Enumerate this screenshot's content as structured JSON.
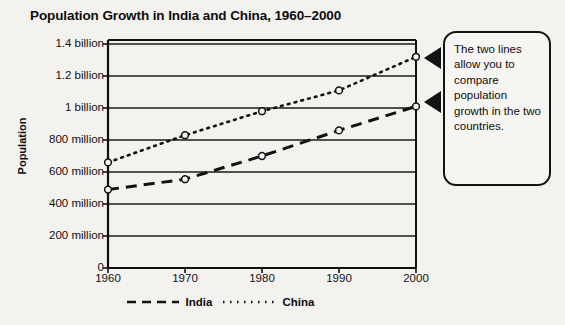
{
  "chart_data": {
    "type": "line",
    "title": "Population Growth in India and China, 1960–2000",
    "xlabel": "",
    "ylabel": "Population",
    "x": [
      1960,
      1970,
      1980,
      1990,
      2000
    ],
    "xtick_labels": [
      "1960",
      "1970",
      "1980",
      "1990",
      "2000"
    ],
    "ylim": [
      0,
      1400000000
    ],
    "ytick_values": [
      0,
      200000000,
      400000000,
      600000000,
      800000000,
      1000000000,
      1200000000,
      1400000000
    ],
    "ytick_labels": [
      "0",
      "200 million",
      "400 million",
      "600 million",
      "800 million",
      "1 billion",
      "1.2 billion",
      "1.4 billion"
    ],
    "grid": true,
    "legend_position": "below",
    "series": [
      {
        "name": "India",
        "style": "dashed",
        "marker": "open-circle",
        "values": [
          490000000,
          555000000,
          700000000,
          860000000,
          1010000000
        ]
      },
      {
        "name": "China",
        "style": "dotted",
        "marker": "open-circle",
        "values": [
          660000000,
          830000000,
          980000000,
          1110000000,
          1320000000
        ]
      }
    ]
  },
  "legend": {
    "entries": [
      {
        "label": "India"
      },
      {
        "label": "China"
      }
    ]
  },
  "callout": {
    "text": "The two lines allow you to compare population growth in the two countries."
  },
  "colors": {
    "ink": "#111111",
    "paper": "#f3f2ef"
  }
}
